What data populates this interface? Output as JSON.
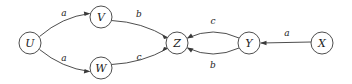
{
  "diagram": {
    "type": "directed-graph",
    "title": "",
    "background_color": "#ffffff",
    "node_stroke_color": "#3a3a3a",
    "edge_stroke_color": "#3a3a3a",
    "label_color": "#1c1c1c",
    "nodes": [
      {
        "id": "U",
        "label": "U",
        "cx": 30,
        "cy": 43,
        "r": 11
      },
      {
        "id": "V",
        "label": "V",
        "cx": 101,
        "cy": 17,
        "r": 11
      },
      {
        "id": "W",
        "label": "W",
        "cx": 101,
        "cy": 68,
        "r": 11
      },
      {
        "id": "Z",
        "label": "Z",
        "cx": 177,
        "cy": 43,
        "r": 11
      },
      {
        "id": "Y",
        "label": "Y",
        "cx": 249,
        "cy": 43,
        "r": 11
      },
      {
        "id": "X",
        "label": "X",
        "cx": 322,
        "cy": 43,
        "r": 11
      }
    ],
    "edges": [
      {
        "id": "u-v",
        "from": "U",
        "to": "V",
        "label": "a",
        "label_x": 64,
        "label_y": 13
      },
      {
        "id": "u-w",
        "from": "U",
        "to": "W",
        "label": "a",
        "label_x": 64,
        "label_y": 58
      },
      {
        "id": "v-z",
        "from": "V",
        "to": "Z",
        "label": "b",
        "label_x": 139,
        "label_y": 14
      },
      {
        "id": "w-z",
        "from": "W",
        "to": "Z",
        "label": "c",
        "label_x": 139,
        "label_y": 57
      },
      {
        "id": "y-z-top",
        "from": "Y",
        "to": "Z",
        "label": "c",
        "label_x": 213,
        "label_y": 21
      },
      {
        "id": "y-z-bottom",
        "from": "Y",
        "to": "Z",
        "label": "b",
        "label_x": 213,
        "label_y": 65
      },
      {
        "id": "x-y",
        "from": "X",
        "to": "Y",
        "label": "a",
        "label_x": 287,
        "label_y": 33
      }
    ]
  }
}
